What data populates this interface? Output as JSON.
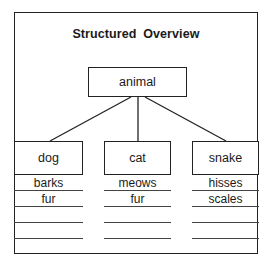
{
  "title": "Structured Overview",
  "root": {
    "label": "animal"
  },
  "children": [
    {
      "label": "dog",
      "attributes": [
        "barks",
        "fur",
        "",
        ""
      ]
    },
    {
      "label": "cat",
      "attributes": [
        "meows",
        "fur",
        "",
        ""
      ]
    },
    {
      "label": "snake",
      "attributes": [
        "hisses",
        "scales",
        "",
        ""
      ]
    }
  ],
  "colors": {
    "line": "#222222",
    "background": "#ffffff"
  }
}
